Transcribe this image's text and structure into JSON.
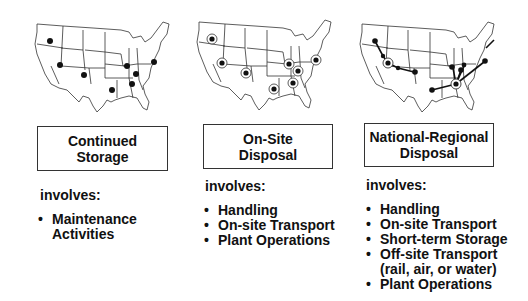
{
  "panels": [
    {
      "title_line1": "Continued",
      "title_line2": "Storage",
      "involves_label": "involves:",
      "items": [
        {
          "text": "Maintenance",
          "cont": "Activities"
        }
      ],
      "map": {
        "style": "solid-dots",
        "dots": [
          [
            17,
            23
          ],
          [
            27,
            47
          ],
          [
            51,
            57
          ],
          [
            94,
            48
          ],
          [
            103,
            70
          ],
          [
            79,
            73
          ],
          [
            97,
            62
          ],
          [
            121,
            44
          ]
        ]
      }
    },
    {
      "title_line1": "On-Site",
      "title_line2": "Disposal",
      "involves_label": "involves:",
      "items": [
        {
          "text": "Handling"
        },
        {
          "text": "On-site Transport"
        },
        {
          "text": "Plant Operations"
        }
      ],
      "map": {
        "style": "ringed-dots",
        "dots": [
          [
            17,
            23
          ],
          [
            27,
            47
          ],
          [
            51,
            57
          ],
          [
            94,
            48
          ],
          [
            103,
            55
          ],
          [
            79,
            73
          ],
          [
            97,
            67
          ],
          [
            121,
            44
          ]
        ]
      }
    },
    {
      "title_line1": "National-Regional",
      "title_line2": "Disposal",
      "involves_label": "involves:",
      "items": [
        {
          "text": "Handling"
        },
        {
          "text": "On-site Transport"
        },
        {
          "text": "Short-term Storage"
        },
        {
          "text": "Off-site Transport",
          "cont": "(rail, air, or water)"
        },
        {
          "text": "Plant Operations"
        }
      ],
      "map": {
        "style": "transport-routes",
        "hubs": [
          [
            30,
            45
          ],
          [
            98,
            64
          ]
        ],
        "dots": [
          [
            17,
            23
          ],
          [
            25,
            40
          ],
          [
            40,
            48
          ],
          [
            56,
            52
          ],
          [
            75,
            65
          ],
          [
            95,
            45
          ],
          [
            101,
            52
          ],
          [
            104,
            48
          ],
          [
            128,
            43
          ]
        ]
      }
    }
  ],
  "bullet_glyph": "•"
}
